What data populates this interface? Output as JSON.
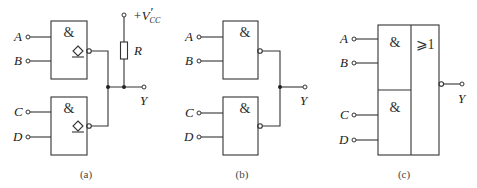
{
  "diagram": {
    "a": {
      "caption": "(a)",
      "gate_symbol": "&",
      "inputs": [
        "A",
        "B",
        "C",
        "D"
      ],
      "output": "Y",
      "resistor": "R",
      "supply": "+V",
      "supply_prime": "′",
      "supply_sub": "CC",
      "open_drain_marker": "◇"
    },
    "b": {
      "caption": "(b)",
      "gate_symbol": "&",
      "inputs": [
        "A",
        "B",
        "C",
        "D"
      ],
      "output": "Y"
    },
    "c": {
      "caption": "(c)",
      "gate_symbol": "&",
      "or_symbol": "⩾1",
      "inputs": [
        "A",
        "B",
        "C",
        "D"
      ],
      "output": "Y"
    }
  }
}
